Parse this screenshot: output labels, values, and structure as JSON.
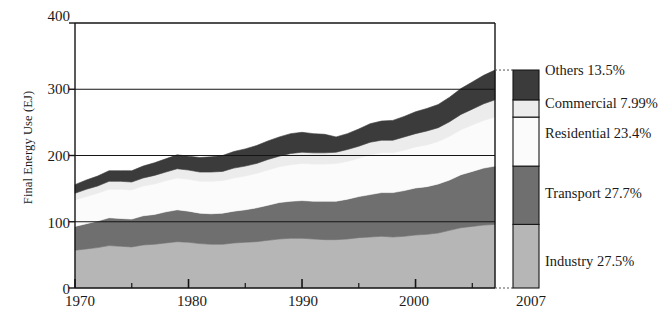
{
  "chart_data": {
    "type": "area",
    "title": "",
    "subtitle": "",
    "xlabel": "",
    "ylabel": "Final Energy Use (EJ)",
    "xlim": [
      1970,
      2007
    ],
    "ylim": [
      0,
      400
    ],
    "yticks": [
      0,
      100,
      200,
      300,
      400
    ],
    "xticks": [
      1970,
      1980,
      1990,
      2000
    ],
    "xminor_step": 5,
    "grid": "horizontal-only",
    "stacked": true,
    "stack_order_bottom_to_top": [
      "Industry",
      "Transport",
      "Residential",
      "Commercial",
      "Others"
    ],
    "legend_position": "right",
    "end_marker_year": "2007",
    "x": [
      1970,
      1971,
      1972,
      1973,
      1974,
      1975,
      1976,
      1977,
      1978,
      1979,
      1980,
      1981,
      1982,
      1983,
      1984,
      1985,
      1986,
      1987,
      1988,
      1989,
      1990,
      1991,
      1992,
      1993,
      1994,
      1995,
      1996,
      1997,
      1998,
      1999,
      2000,
      2001,
      2002,
      2003,
      2004,
      2005,
      2006,
      2007
    ],
    "series": [
      {
        "name": "Industry",
        "share_2007": "27.5%",
        "color": "#b6b6b6",
        "values": [
          57,
          59,
          61,
          64,
          63,
          62,
          65,
          66,
          68,
          70,
          69,
          67,
          66,
          66,
          68,
          69,
          70,
          72,
          74,
          75,
          75,
          74,
          73,
          73,
          74,
          76,
          77,
          78,
          77,
          78,
          80,
          81,
          83,
          87,
          91,
          93,
          95,
          96
        ]
      },
      {
        "name": "Transport",
        "share_2007": "27.7%",
        "color": "#6f6f6f",
        "values": [
          36,
          38,
          40,
          42,
          42,
          42,
          44,
          45,
          47,
          48,
          47,
          46,
          46,
          47,
          48,
          49,
          51,
          53,
          55,
          56,
          57,
          57,
          58,
          58,
          60,
          62,
          64,
          66,
          67,
          69,
          71,
          72,
          74,
          76,
          80,
          83,
          86,
          88
        ]
      },
      {
        "name": "Residential",
        "share_2007": "23.4%",
        "color": "#fbfbfb",
        "values": [
          40,
          41,
          42,
          43,
          44,
          44,
          45,
          46,
          47,
          48,
          48,
          48,
          49,
          49,
          50,
          51,
          52,
          53,
          54,
          55,
          56,
          56,
          56,
          57,
          57,
          58,
          60,
          60,
          60,
          61,
          62,
          63,
          64,
          66,
          68,
          70,
          72,
          74
        ]
      },
      {
        "name": "Commercial",
        "share_2007": "7.99%",
        "color": "#ececec",
        "values": [
          10,
          11,
          11,
          12,
          12,
          12,
          12,
          13,
          13,
          14,
          14,
          14,
          14,
          14,
          15,
          15,
          15,
          16,
          16,
          17,
          17,
          17,
          17,
          17,
          18,
          18,
          19,
          19,
          19,
          20,
          20,
          21,
          21,
          22,
          23,
          24,
          25,
          26
        ]
      },
      {
        "name": "Others",
        "share_2007": "13.5%",
        "color": "#3b3b3b",
        "values": [
          13,
          14,
          15,
          16,
          16,
          17,
          18,
          19,
          20,
          21,
          21,
          22,
          23,
          24,
          25,
          26,
          27,
          28,
          29,
          30,
          30,
          29,
          28,
          23,
          24,
          26,
          28,
          29,
          30,
          31,
          33,
          34,
          35,
          37,
          39,
          41,
          43,
          45
        ]
      }
    ]
  },
  "axes": {
    "ylabel": "Final Energy Use (EJ)",
    "ytick_labels": [
      "400",
      "300",
      "200",
      "100",
      "0"
    ],
    "xtick_labels": [
      "1970",
      "1980",
      "1990",
      "2000"
    ],
    "end_label": "2007"
  },
  "legend": {
    "items": [
      {
        "label": "Others 13.5%",
        "swatch": "others-swatch",
        "color": "#3b3b3b"
      },
      {
        "label": "Commercial 7.99%",
        "swatch": "commercial-swatch",
        "color": "#ececec"
      },
      {
        "label": "Residential 23.4%",
        "swatch": "residential-swatch",
        "color": "#fbfbfb"
      },
      {
        "label": "Transport 27.7%",
        "swatch": "transport-swatch",
        "color": "#6f6f6f"
      },
      {
        "label": "Industry 27.5%",
        "swatch": "industry-swatch",
        "color": "#b6b6b6"
      }
    ]
  }
}
